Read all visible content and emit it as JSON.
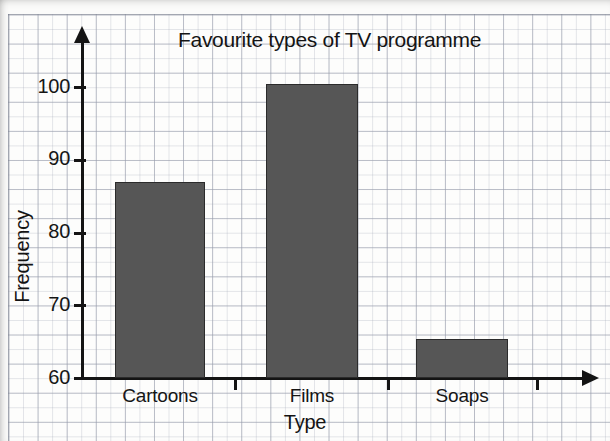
{
  "chart_data": {
    "type": "bar",
    "title": "Favourite types of TV programme",
    "xlabel": "Type",
    "ylabel": "Frequency",
    "categories": [
      "Cartoons",
      "Films",
      "Soaps"
    ],
    "values": [
      87,
      100.5,
      65.5
    ],
    "ylim": [
      60,
      103
    ],
    "yticks": [
      60,
      70,
      80,
      90,
      100
    ],
    "ytick_labels": [
      "60",
      "70",
      "80",
      "90",
      "100"
    ],
    "grid": "graph-paper, minor squares with major every 2 minor",
    "legend": "none",
    "bar_color": "#565656",
    "bar_edge_color": "#2b2b2b",
    "axis_color": "#141414",
    "grid_color": "#969baa",
    "background_color": "#fdfdfc"
  },
  "axes": {
    "y_arrow": "arrow-up",
    "x_arrow": "arrow-right"
  }
}
